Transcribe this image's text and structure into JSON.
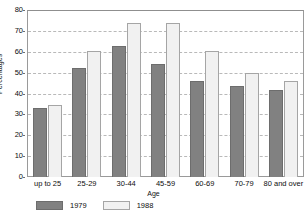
{
  "chart_data": {
    "type": "bar",
    "title": "",
    "xlabel": "Age",
    "ylabel": "Percentages",
    "ylim": [
      0,
      80
    ],
    "yticks": [
      0,
      10,
      20,
      30,
      40,
      50,
      60,
      70,
      80
    ],
    "grid": true,
    "legend_position": "bottom-left",
    "categories": [
      "up to 25",
      "25-29",
      "30-44",
      "45-59",
      "60-69",
      "70-79",
      "80 and over"
    ],
    "series": [
      {
        "name": "1979",
        "color": "#818181",
        "values": [
          33,
          52,
          63,
          54,
          46,
          43.5,
          41.5
        ]
      },
      {
        "name": "1988",
        "color": "#f1f1f1",
        "values": [
          34.5,
          60.5,
          74,
          74,
          60.5,
          50,
          46
        ]
      }
    ]
  },
  "axis": {
    "y_title": "Percentages",
    "x_title": "Age",
    "y_tick_labels": [
      "0",
      "10",
      "20",
      "30",
      "40",
      "50",
      "60",
      "70",
      "80"
    ],
    "x_tick_labels": [
      "up to 25",
      "25-29",
      "30-44",
      "45-59",
      "60-69",
      "70-79",
      "80 and over"
    ]
  },
  "legend": {
    "items": [
      {
        "label": "1979",
        "swatch": "dark-gray-swatch"
      },
      {
        "label": "1988",
        "swatch": "light-gray-swatch"
      }
    ]
  },
  "misc": {
    "corner_mark": ""
  }
}
